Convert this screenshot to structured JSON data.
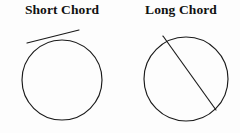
{
  "figure": {
    "background_color": "#fdfdfd",
    "ink_color": "#1a1a1a",
    "ghost_text_color": "#e9e9ea",
    "panels": [
      {
        "id": "short-chord",
        "title": "Short Chord",
        "circle": {
          "cx": 62,
          "cy": 80,
          "r": 40
        },
        "chord": {
          "x1": 27,
          "y1": 43,
          "x2": 79,
          "y2": 30
        },
        "chord_type": "short",
        "description": "Circle with a short chord near the top cutting off a thin sliver"
      },
      {
        "id": "long-chord",
        "title": "Long Chord",
        "circle": {
          "cx": 186,
          "cy": 79,
          "r": 42
        },
        "chord": {
          "x1": 163,
          "y1": 36,
          "x2": 216,
          "y2": 110
        },
        "chord_type": "long",
        "description": "Circle with a long chord running from upper-left to lower-right near the centre"
      }
    ]
  },
  "ghost_text": {
    "line1": " ",
    "line2": " ",
    "line3": " ",
    "line4": " "
  }
}
